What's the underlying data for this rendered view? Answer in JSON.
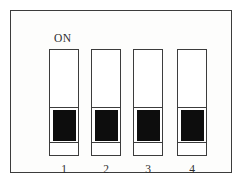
{
  "figure": {
    "background_color": "#ffffff",
    "enclosure": {
      "name": "dip-switch-housing",
      "fill_color": "#fdfdfc",
      "border_color": "#3c3c3c"
    },
    "on_label": "ON",
    "switch_body_color": "#ffffff",
    "switch_border_color": "#3c3c3c",
    "actuator_color": "#0d0d0d",
    "switches": [
      {
        "number": "1",
        "position": "down",
        "state": "OFF"
      },
      {
        "number": "2",
        "position": "down",
        "state": "OFF"
      },
      {
        "number": "3",
        "position": "down",
        "state": "OFF"
      },
      {
        "number": "4",
        "position": "down",
        "state": "OFF"
      }
    ]
  }
}
